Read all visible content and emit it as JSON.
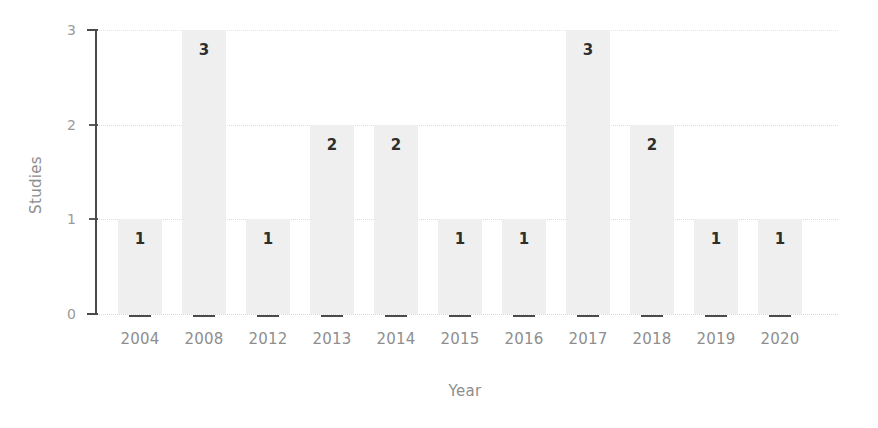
{
  "chart_data": {
    "type": "bar",
    "title": "",
    "subtitle": "",
    "xlabel": "Year",
    "ylabel": "Studies",
    "categories": [
      "2004",
      "2008",
      "2012",
      "2013",
      "2014",
      "2015",
      "2016",
      "2017",
      "2018",
      "2019",
      "2020"
    ],
    "values": [
      1,
      3,
      1,
      2,
      2,
      1,
      1,
      3,
      2,
      1,
      1
    ],
    "data_labels": [
      "1",
      "3",
      "1",
      "2",
      "2",
      "1",
      "1",
      "3",
      "2",
      "1",
      "1"
    ],
    "ylim": [
      0,
      3
    ],
    "y_ticks": [
      "0",
      "1",
      "2",
      "3"
    ],
    "y_tick_values": [
      0,
      1,
      2,
      3
    ],
    "grid": "horizontal-dotted",
    "legend": "none",
    "bar_color": "#efefef",
    "label_color": "#2e2e2e",
    "axis_color": "#4a4a4a",
    "tick_text_color": "#8e8e8e",
    "gridline_color": "#dcdcdc",
    "background_color": "#ffffff"
  }
}
